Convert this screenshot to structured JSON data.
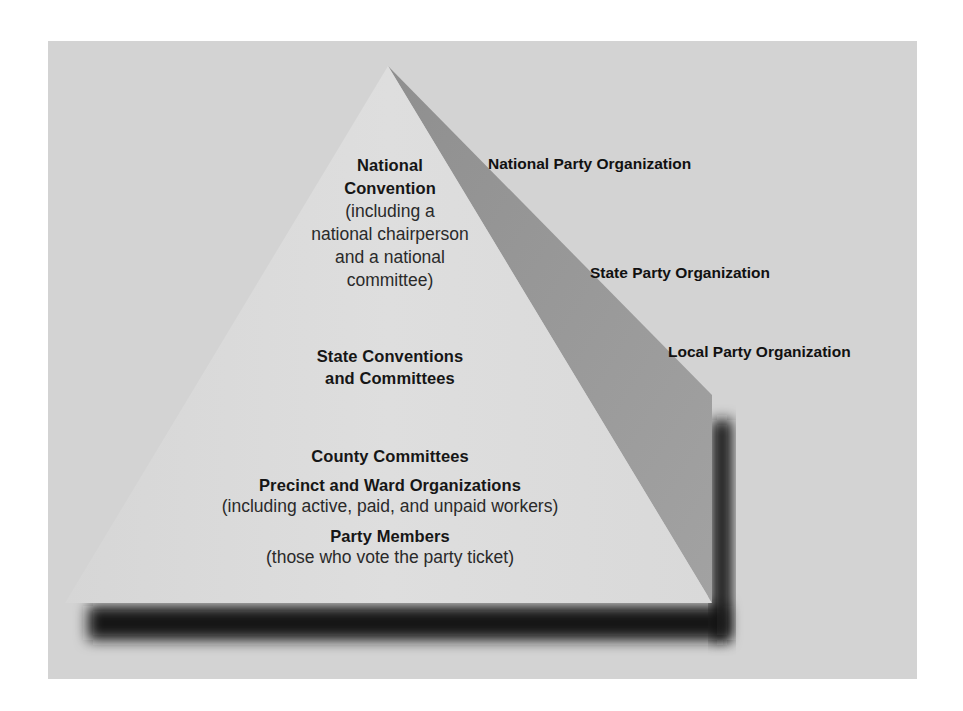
{
  "diagram": {
    "type": "pyramid",
    "tiers": [
      {
        "level": "national",
        "title_lines": [
          "National",
          "Convention"
        ],
        "detail_lines": [
          "(including a",
          "national chairperson",
          "and a national",
          "committee)"
        ]
      },
      {
        "level": "state",
        "title_lines": [
          "State Conventions",
          "and Committees"
        ]
      },
      {
        "level": "local",
        "items": [
          {
            "title": "County Committees"
          },
          {
            "title": "Precinct and Ward Organizations",
            "detail": "(including active, paid, and unpaid workers)"
          },
          {
            "title": "Party Members",
            "detail": "(those who vote the party ticket)"
          }
        ]
      }
    ],
    "side_labels": {
      "national": "National Party Organization",
      "state": "State Party Organization",
      "local": "Local Party Organization"
    },
    "colors": {
      "background_panel": "#d3d3d3",
      "front_face": "#dcdcdc",
      "side_face": "#9b9b9b",
      "divider": "#8c8c8c",
      "shadow": "#151515"
    }
  }
}
